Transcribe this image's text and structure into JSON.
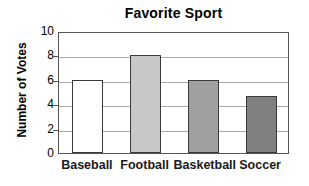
{
  "chart_data": {
    "type": "bar",
    "title": "Favorite Sport",
    "xlabel": "",
    "ylabel": "Number of Votes",
    "categories": [
      "Baseball",
      "Football",
      "Basketball",
      "Soccer"
    ],
    "values": [
      6,
      8,
      6,
      4.7
    ],
    "bar_colors": [
      "#ffffff",
      "#c8c8c8",
      "#a0a0a0",
      "#808080"
    ],
    "bar_border_color": "#3a3a3a",
    "ylim": [
      0,
      10
    ],
    "y_ticks": [
      0,
      2,
      4,
      6,
      8,
      10
    ],
    "y_tick_labels": [
      "0",
      "2",
      "4",
      "6",
      "8",
      "10"
    ],
    "grid": "horizontal",
    "gridline_values": [
      2,
      4,
      6,
      8
    ],
    "gridline_color": "#a9a9a9",
    "legend": "none",
    "frame_color": "#555555",
    "background_color": "#ffffff"
  },
  "axis": {
    "y_title": "Number of Votes",
    "ticks": [
      {
        "label": "10",
        "value": 10
      },
      {
        "label": "8",
        "value": 8
      },
      {
        "label": "6",
        "value": 6
      },
      {
        "label": "4",
        "value": 4
      },
      {
        "label": "2",
        "value": 2
      },
      {
        "label": "0",
        "value": 0
      }
    ]
  },
  "bars": [
    {
      "label": "Baseball",
      "value": 6,
      "color": "#ffffff"
    },
    {
      "label": "Football",
      "value": 8,
      "color": "#c8c8c8"
    },
    {
      "label": "Basketball",
      "value": 6,
      "color": "#a0a0a0"
    },
    {
      "label": "Soccer",
      "value": 4.7,
      "color": "#808080"
    }
  ]
}
